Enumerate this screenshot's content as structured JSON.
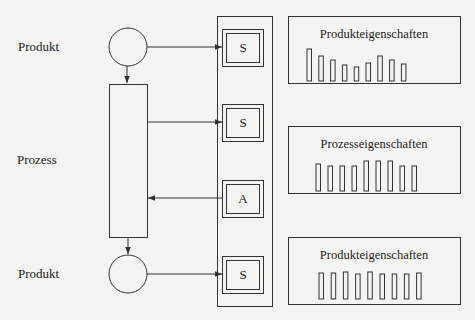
{
  "labels": {
    "product_top": "Produkt",
    "process": "Prozess",
    "product_bottom": "Produkt"
  },
  "boxes": [
    {
      "letter": "S",
      "role": "sensor"
    },
    {
      "letter": "S",
      "role": "sensor"
    },
    {
      "letter": "A",
      "role": "actuator"
    },
    {
      "letter": "S",
      "role": "sensor"
    }
  ],
  "panels": [
    {
      "title": "Produkteigenschaften",
      "bars": [
        32,
        25,
        21,
        16,
        14,
        18,
        25,
        21,
        17
      ]
    },
    {
      "title": "Prozesseigenschaften",
      "bars": [
        27,
        25,
        25,
        25,
        30,
        30,
        30,
        25,
        25
      ]
    },
    {
      "title": "Produkteigenschaften",
      "bars": [
        26,
        26,
        27,
        25,
        27,
        25,
        25,
        25,
        26
      ]
    }
  ],
  "colors": {
    "line": "#333333",
    "background": "#f4f4f2"
  }
}
